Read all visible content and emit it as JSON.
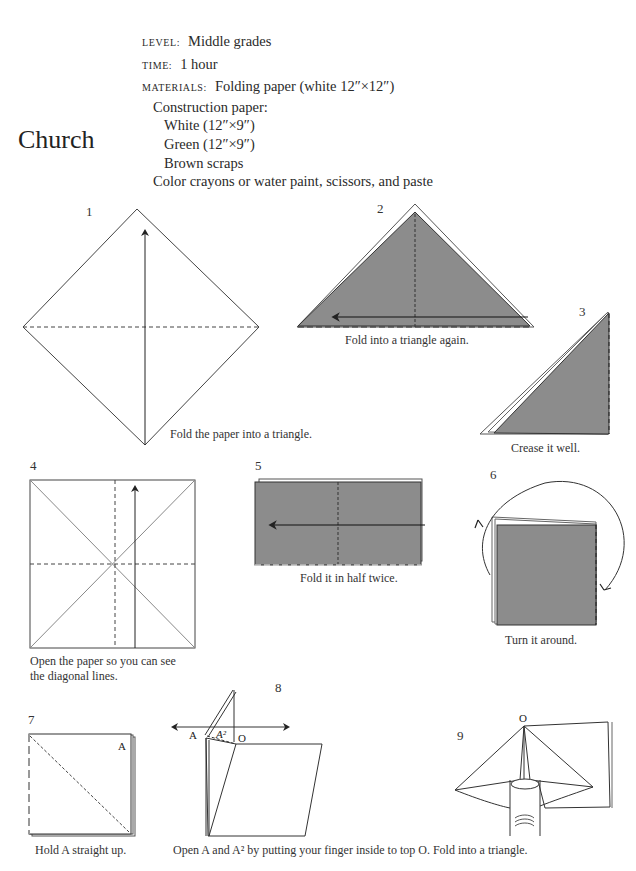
{
  "page": {
    "title": "Church",
    "meta": {
      "level_label": "LEVEL:",
      "level_value": "Middle grades",
      "time_label": "TIME:",
      "time_value": "1 hour",
      "materials_label": "MATERIALS:",
      "materials": [
        "Folding paper (white 12″×12″)",
        "Construction paper:",
        "White (12″×9″)",
        "Green (12″×9″)",
        "Brown scraps",
        "Color crayons or water paint, scissors, and paste"
      ]
    }
  },
  "steps": [
    {
      "number": "1",
      "caption": "Fold the paper into a triangle."
    },
    {
      "number": "2",
      "caption": "Fold into a triangle again."
    },
    {
      "number": "3",
      "caption": "Crease it well."
    },
    {
      "number": "4",
      "caption_line1": "Open the paper so you can see",
      "caption_line2": "the diagonal lines."
    },
    {
      "number": "5",
      "caption": "Fold it in half twice."
    },
    {
      "number": "6",
      "caption": "Turn it around."
    },
    {
      "number": "7",
      "caption": "Hold A straight up.",
      "point_label": "A"
    },
    {
      "number": "8",
      "caption": "Open A and A² by putting your finger inside to top O. Fold into a triangle.",
      "labels": [
        "A",
        "A²",
        "O"
      ]
    },
    {
      "number": "9",
      "labels": [
        "O"
      ]
    }
  ],
  "colors": {
    "paper_fill": "#8c8c8c",
    "line": "#333333"
  }
}
